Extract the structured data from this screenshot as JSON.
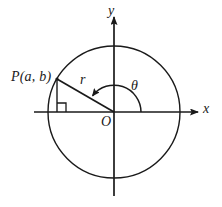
{
  "figure": {
    "labels": {
      "point_p": "P(a, b)",
      "radius": "r",
      "angle": "θ",
      "x_axis": "x",
      "y_axis": "y",
      "origin": "O"
    },
    "colors": {
      "stroke": "#1a1a1a",
      "background": "#ffffff"
    },
    "geometry": {
      "origin": {
        "x": 114,
        "y": 112
      },
      "circle_radius": 66,
      "point_p": {
        "x": 57,
        "y": 79
      },
      "x_axis": {
        "x1": 34,
        "x2": 200,
        "y": 112
      },
      "y_axis": {
        "x": 114,
        "y1": 14,
        "y2": 196
      },
      "right_angle_marker": {
        "x": 57,
        "y": 112,
        "size": 9
      },
      "angle_arc_radius": 27,
      "angle_start_deg": 0,
      "angle_end_deg": 150
    }
  }
}
